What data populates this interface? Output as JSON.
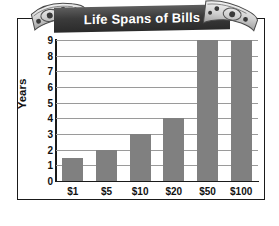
{
  "chart_data": {
    "type": "bar",
    "title": "Life Spans of Bills",
    "xlabel": "",
    "ylabel": "Years",
    "categories": [
      "$1",
      "$5",
      "$10",
      "$20",
      "$50",
      "$100"
    ],
    "values": [
      1.5,
      2,
      3,
      4,
      9,
      9
    ],
    "ylim": [
      0,
      9
    ],
    "yticks": [
      0,
      1,
      2,
      3,
      4,
      5,
      6,
      7,
      8,
      9
    ],
    "ytick_labels": [
      "0",
      "1",
      "2",
      "3",
      "4",
      "5",
      "6",
      "7",
      "8",
      "9"
    ],
    "grid": true,
    "legend": false,
    "bar_color": "#808080",
    "title_background": "#3b3b3b",
    "title_color": "#ffffff",
    "axis_color": "#1a1a1a",
    "gridline_color": "#9a9a9a"
  },
  "decorations": {
    "bill_left": "dollar-bill-illustration",
    "bill_right": "dollar-bill-illustration"
  }
}
